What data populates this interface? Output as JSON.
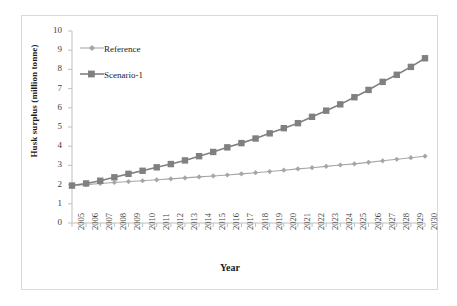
{
  "chart_data": {
    "type": "line",
    "title": "",
    "xlabel": "Year",
    "ylabel": "Husk surplus (million tonne)",
    "xlim": [
      2005,
      2030
    ],
    "ylim": [
      0,
      10
    ],
    "ytick_labels": [
      "0",
      "1",
      "2",
      "3",
      "4",
      "5",
      "6",
      "7",
      "8",
      "9",
      "10"
    ],
    "ytick_values": [
      0,
      1,
      2,
      3,
      4,
      5,
      6,
      7,
      8,
      9,
      10
    ],
    "grid": false,
    "legend_position": "top-left",
    "categories": [
      "2005",
      "2006",
      "2007",
      "2008",
      "2009",
      "2010",
      "2011",
      "2012",
      "2013",
      "2014",
      "2015",
      "2016",
      "2017",
      "2018",
      "2019",
      "2020",
      "2021",
      "2022",
      "2023",
      "2024",
      "2025",
      "2026",
      "2027",
      "2028",
      "2029",
      "2030"
    ],
    "x": [
      2005,
      2006,
      2007,
      2008,
      2009,
      2010,
      2011,
      2012,
      2013,
      2014,
      2015,
      2016,
      2017,
      2018,
      2019,
      2020,
      2021,
      2022,
      2023,
      2024,
      2025,
      2026,
      2027,
      2028,
      2029,
      2030
    ],
    "series": [
      {
        "name": "Reference",
        "color": "#a6a6a6",
        "marker": "diamond",
        "values": [
          1.95,
          2.0,
          2.06,
          2.11,
          2.16,
          2.2,
          2.25,
          2.3,
          2.35,
          2.4,
          2.45,
          2.5,
          2.56,
          2.62,
          2.68,
          2.75,
          2.82,
          2.88,
          2.95,
          3.02,
          3.08,
          3.16,
          3.24,
          3.32,
          3.4,
          3.48
        ]
      },
      {
        "name": "Scenario-1",
        "color": "#808080",
        "marker": "square",
        "values": [
          1.95,
          2.06,
          2.2,
          2.38,
          2.56,
          2.72,
          2.9,
          3.07,
          3.26,
          3.48,
          3.7,
          3.94,
          4.16,
          4.4,
          4.67,
          4.94,
          5.2,
          5.53,
          5.85,
          6.18,
          6.55,
          6.93,
          7.35,
          7.72,
          8.13,
          8.58
        ]
      }
    ]
  },
  "legend": {
    "items": [
      {
        "label": "Reference"
      },
      {
        "label": "Scenario-1"
      }
    ]
  },
  "colors": {
    "reference": "#a6a6a6",
    "scenario1": "#808080",
    "axis": "#bfbfbf",
    "text": "#404040",
    "frame": "#d9d9d9"
  }
}
